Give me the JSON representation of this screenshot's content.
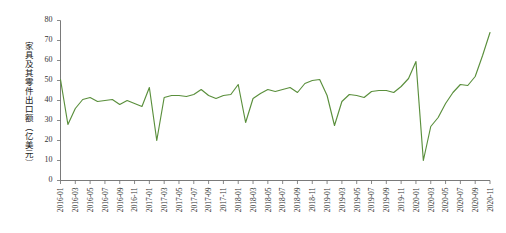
{
  "chart_data": {
    "type": "line",
    "title": "",
    "xlabel": "",
    "ylabel": "家具及其零件出口额（亿美元）",
    "ylim": [
      0,
      80
    ],
    "yticks": [
      0,
      10,
      20,
      30,
      40,
      50,
      60,
      70,
      80
    ],
    "grid": false,
    "legend": "none",
    "line_color": "#5a8f3c",
    "axis_color": "#6b6b6b",
    "x_tick_interval_months": 2,
    "x_tick_labels": [
      "2016-01",
      "2016-03",
      "2016-05",
      "2016-07",
      "2016-09",
      "2016-11",
      "2017-01",
      "2017-03",
      "2017-05",
      "2017-07",
      "2017-09",
      "2017-11",
      "2018-01",
      "2018-03",
      "2018-05",
      "2018-07",
      "2018-09",
      "2018-11",
      "2019-01",
      "2019-03",
      "2019-05",
      "2019-07",
      "2019-09",
      "2019-11",
      "2020-01",
      "2020-03",
      "2020-05",
      "2020-07",
      "2020-09",
      "2020-11"
    ],
    "x": [
      "2016-01",
      "2016-02",
      "2016-03",
      "2016-04",
      "2016-05",
      "2016-06",
      "2016-07",
      "2016-08",
      "2016-09",
      "2016-10",
      "2016-11",
      "2016-12",
      "2017-01",
      "2017-02",
      "2017-03",
      "2017-04",
      "2017-05",
      "2017-06",
      "2017-07",
      "2017-08",
      "2017-09",
      "2017-10",
      "2017-11",
      "2017-12",
      "2018-01",
      "2018-02",
      "2018-03",
      "2018-04",
      "2018-05",
      "2018-06",
      "2018-07",
      "2018-08",
      "2018-09",
      "2018-10",
      "2018-11",
      "2018-12",
      "2019-01",
      "2019-02",
      "2019-03",
      "2019-04",
      "2019-05",
      "2019-06",
      "2019-07",
      "2019-08",
      "2019-09",
      "2019-10",
      "2019-11",
      "2019-12",
      "2020-01",
      "2020-02",
      "2020-03",
      "2020-04",
      "2020-05",
      "2020-06",
      "2020-07",
      "2020-08",
      "2020-09",
      "2020-10",
      "2020-11"
    ],
    "series": [
      {
        "name": "家具及其零件出口额",
        "unit": "亿美元",
        "values": [
          50.5,
          28.0,
          36.0,
          40.5,
          41.5,
          39.5,
          40.0,
          40.5,
          38.0,
          40.0,
          38.5,
          37.0,
          46.5,
          20.0,
          41.5,
          42.5,
          42.5,
          42.0,
          43.0,
          45.5,
          42.5,
          41.0,
          42.5,
          43.0,
          48.0,
          29.0,
          41.0,
          43.5,
          45.5,
          44.5,
          45.5,
          46.5,
          44.0,
          48.5,
          50.0,
          50.5,
          42.5,
          27.5,
          39.5,
          43.0,
          42.5,
          41.5,
          44.5,
          45.0,
          45.0,
          44.0,
          47.0,
          51.0,
          59.5,
          10.0,
          27.0,
          31.5,
          38.5,
          44.0,
          48.0,
          47.5,
          52.0,
          62.5,
          74.0
        ]
      }
    ]
  }
}
